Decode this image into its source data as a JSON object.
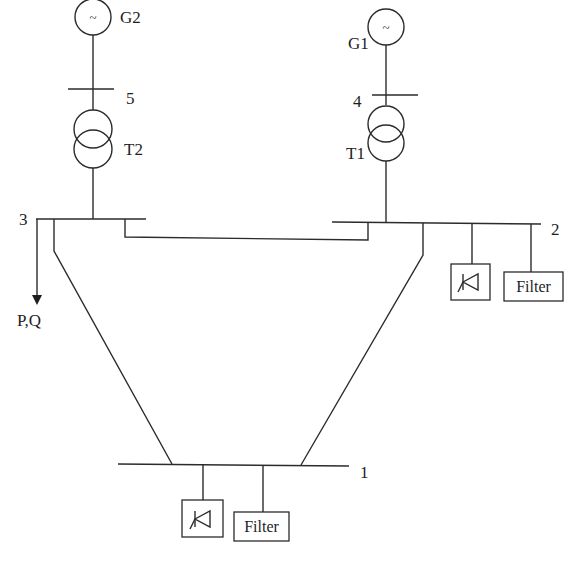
{
  "diagram": {
    "type": "power-system-single-line-diagram",
    "line_color": "#2b2b2b",
    "background": "#ffffff",
    "generators": [
      {
        "id": "G2",
        "label": "G2",
        "symbol": "~",
        "connects_to_bus": "5"
      },
      {
        "id": "G1",
        "label": "G1",
        "symbol": "~",
        "connects_to_bus": "4"
      }
    ],
    "transformers": [
      {
        "id": "T2",
        "label": "T2",
        "between": [
          "5",
          "3"
        ]
      },
      {
        "id": "T1",
        "label": "T1",
        "between": [
          "4",
          "2"
        ]
      }
    ],
    "buses": [
      {
        "id": "1",
        "label": "1"
      },
      {
        "id": "2",
        "label": "2"
      },
      {
        "id": "3",
        "label": "3"
      },
      {
        "id": "4",
        "label": "4"
      },
      {
        "id": "5",
        "label": "5"
      }
    ],
    "lines": [
      {
        "from": "3",
        "to": "2"
      },
      {
        "from": "3",
        "to": "1"
      },
      {
        "from": "2",
        "to": "1"
      }
    ],
    "load": {
      "bus": "3",
      "label": "P,Q"
    },
    "bus2_devices": {
      "converter": {
        "label": "",
        "symbol": "thyristor"
      },
      "filter": {
        "label": "Filter"
      }
    },
    "bus1_devices": {
      "converter": {
        "label": "",
        "symbol": "thyristor"
      },
      "filter": {
        "label": "Filter"
      }
    }
  }
}
